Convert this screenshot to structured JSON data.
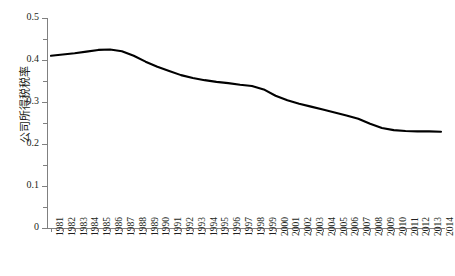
{
  "chart_data": {
    "type": "line",
    "title": "",
    "xlabel": "",
    "ylabel": "公司所得税税率",
    "ylim": [
      0,
      0.5
    ],
    "ytick_values": [
      0,
      0.1,
      0.2,
      0.3,
      0.4,
      0.5
    ],
    "ytick_labels": [
      "0",
      "0.1",
      "0.2",
      "0.3",
      "0.4",
      "0.5"
    ],
    "yminor_values": [
      0.05,
      0.15,
      0.25,
      0.35,
      0.45
    ],
    "grid": false,
    "legend": "none",
    "line_color": "#000000",
    "categories": [
      "1981",
      "1982",
      "1983",
      "1984",
      "1985",
      "1986",
      "1987",
      "1988",
      "1989",
      "1990",
      "1991",
      "1992",
      "1993",
      "1994",
      "1995",
      "1996",
      "1997",
      "1998",
      "1999",
      "2000",
      "2001",
      "2002",
      "2003",
      "2004",
      "2005",
      "2006",
      "2007",
      "2008",
      "2009",
      "2010",
      "2011",
      "2012",
      "2013",
      "2014"
    ],
    "values": [
      0.41,
      0.413,
      0.416,
      0.42,
      0.424,
      0.425,
      0.421,
      0.41,
      0.396,
      0.384,
      0.374,
      0.364,
      0.357,
      0.352,
      0.348,
      0.345,
      0.341,
      0.338,
      0.33,
      0.315,
      0.304,
      0.296,
      0.289,
      0.282,
      0.275,
      0.268,
      0.26,
      0.248,
      0.238,
      0.233,
      0.231,
      0.23,
      0.23,
      0.229
    ]
  }
}
